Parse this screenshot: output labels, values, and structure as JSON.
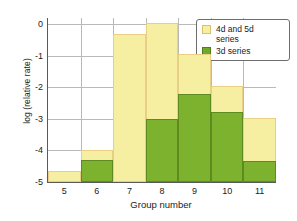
{
  "chart_data": {
    "type": "bar",
    "title": "",
    "xlabel": "Group number",
    "ylabel": "log (relative rate)",
    "categories": [
      "5",
      "6",
      "7",
      "8",
      "9",
      "10",
      "11"
    ],
    "ylim": [
      -5,
      0.2
    ],
    "xlim": [
      4.5,
      11.5
    ],
    "yticks": [
      "0",
      "-1",
      "-2",
      "-3",
      "-4",
      "-5"
    ],
    "ytick_values": [
      0,
      -1,
      -2,
      -3,
      -4,
      -5
    ],
    "grid": true,
    "legend_position": "top-right",
    "stacked_overlay": true,
    "series": [
      {
        "name": "4d and 5d series",
        "color": "#f6efa2",
        "edge_color": "#e8cf83",
        "values": [
          -4.65,
          -4.0,
          -0.3,
          0.05,
          -0.95,
          -1.95,
          -2.97
        ]
      },
      {
        "name": "3d series",
        "color": "#7cb22e",
        "edge_color": "#5e8a21",
        "values": [
          null,
          -4.3,
          null,
          -3.0,
          -2.2,
          -2.78,
          -4.32
        ]
      }
    ]
  },
  "legend": {
    "entries": [
      {
        "label_line1": "4d and 5d",
        "label_line2": "series",
        "swatch": "yellow-swatch"
      },
      {
        "label_line1": "3d series",
        "label_line2": "",
        "swatch": "green-swatch"
      }
    ]
  }
}
